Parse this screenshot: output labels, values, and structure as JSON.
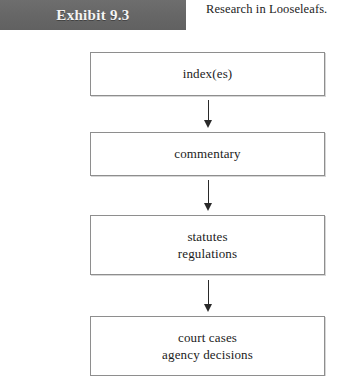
{
  "banner": {
    "label": "Exhibit 9.3"
  },
  "caption": {
    "text": "Research in Looseleafs."
  },
  "colors": {
    "banner_background": "#6b6b6b",
    "banner_text": "#f4f4f4",
    "box_border": "#8e8e8e",
    "box_background": "#ffffff",
    "arrow": "#2a2a2a",
    "body_text": "#1b1b1b",
    "page_background": "#ffffff"
  },
  "flow": {
    "nodes": [
      {
        "id": "index",
        "lines": [
          "index(es)"
        ]
      },
      {
        "id": "commentary",
        "lines": [
          "commentary"
        ]
      },
      {
        "id": "statutes",
        "lines": [
          "statutes",
          "regulations"
        ]
      },
      {
        "id": "court-cases",
        "lines": [
          "court cases",
          "agency decisions"
        ]
      }
    ],
    "connectors": [
      {
        "id": "arrow-1",
        "from": "index",
        "to": "commentary",
        "direction": "down"
      },
      {
        "id": "arrow-2",
        "from": "commentary",
        "to": "statutes",
        "direction": "down"
      },
      {
        "id": "arrow-3",
        "from": "statutes",
        "to": "court-cases",
        "direction": "down"
      }
    ]
  }
}
